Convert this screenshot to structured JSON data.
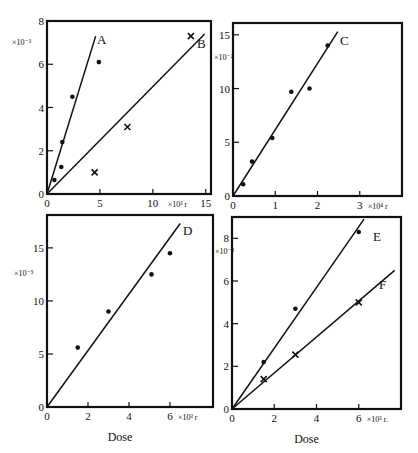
{
  "figure": {
    "width": 418,
    "height": 453,
    "ink_color": "#111111",
    "background": "#ffffff"
  },
  "chart_data": [
    {
      "type": "scatter",
      "panel": "top-left",
      "title": "",
      "xlabel": "",
      "x_unit_label": "×10³ r",
      "y_multiplier_label": "×10⁻³",
      "xlim": [
        0,
        15.5
      ],
      "ylim": [
        0,
        8
      ],
      "xticks": [
        0,
        5,
        10,
        15
      ],
      "yticks": [
        0,
        2,
        4,
        6,
        8
      ],
      "grid": false,
      "series": [
        {
          "name": "A",
          "marker": "dot",
          "points": [
            [
              0.7,
              0.65
            ],
            [
              1.35,
              1.25
            ],
            [
              1.45,
              2.4
            ],
            [
              2.4,
              4.5
            ],
            [
              4.9,
              6.1
            ]
          ],
          "fit_line": [
            [
              0,
              0
            ],
            [
              4.6,
              7.3
            ]
          ]
        },
        {
          "name": "B",
          "marker": "cross",
          "points": [
            [
              4.5,
              1.0
            ],
            [
              7.6,
              3.1
            ],
            [
              13.6,
              7.3
            ]
          ],
          "fit_line": [
            [
              0,
              0
            ],
            [
              14.9,
              7.4
            ]
          ]
        }
      ]
    },
    {
      "type": "scatter",
      "panel": "top-right",
      "title": "",
      "xlabel": "",
      "x_unit_label": "×10⁴ r",
      "y_multiplier_label": "×10⁻²",
      "xlim": [
        0,
        4.0
      ],
      "ylim": [
        0,
        16.1
      ],
      "xticks": [
        0,
        1,
        2,
        3
      ],
      "yticks": [
        0,
        5,
        10,
        15
      ],
      "grid": false,
      "series": [
        {
          "name": "C",
          "marker": "dot",
          "points": [
            [
              0.24,
              1.1
            ],
            [
              0.45,
              3.2
            ],
            [
              0.93,
              5.4
            ],
            [
              1.38,
              9.7
            ],
            [
              1.81,
              10.0
            ],
            [
              2.24,
              14.0
            ]
          ],
          "fit_line": [
            [
              0,
              0
            ],
            [
              2.48,
              15.3
            ]
          ]
        }
      ]
    },
    {
      "type": "scatter",
      "panel": "bottom-left",
      "title": "",
      "xlabel": "Dose",
      "x_unit_label": "×10³ r",
      "y_multiplier_label": "×10⁻⁵",
      "xlim": [
        0,
        8.1
      ],
      "ylim": [
        0,
        18.1
      ],
      "xticks": [
        0,
        2,
        4,
        6
      ],
      "yticks": [
        0,
        5,
        10,
        15
      ],
      "grid": false,
      "series": [
        {
          "name": "D",
          "marker": "dot",
          "points": [
            [
              1.5,
              5.6
            ],
            [
              3.0,
              9.0
            ],
            [
              5.1,
              12.5
            ],
            [
              6.0,
              14.5
            ]
          ],
          "fit_line": [
            [
              0,
              0
            ],
            [
              6.5,
              17.3
            ]
          ]
        }
      ]
    },
    {
      "type": "scatter",
      "panel": "bottom-right",
      "title": "",
      "xlabel": "Dose",
      "x_unit_label": "×10³ r.",
      "y_multiplier_label": "×10⁻³",
      "xlim": [
        0,
        8.0
      ],
      "ylim": [
        0,
        9.0
      ],
      "xticks": [
        0,
        2,
        4,
        6
      ],
      "yticks": [
        0,
        2,
        4,
        6,
        8
      ],
      "grid": false,
      "series": [
        {
          "name": "E",
          "marker": "dot",
          "points": [
            [
              1.5,
              2.2
            ],
            [
              3.0,
              4.7
            ],
            [
              6.0,
              8.3
            ]
          ],
          "fit_line": [
            [
              0,
              0
            ],
            [
              6.25,
              8.9
            ]
          ]
        },
        {
          "name": "F",
          "marker": "cross",
          "points": [
            [
              1.5,
              1.4
            ],
            [
              3.0,
              2.55
            ],
            [
              6.0,
              5.0
            ]
          ],
          "fit_line": [
            [
              0,
              0
            ],
            [
              7.7,
              6.5
            ]
          ]
        }
      ]
    }
  ],
  "layout": [
    {
      "left": 47,
      "top": 21,
      "right": 211,
      "bottom": 194,
      "label_pos": {
        "A": [
          97,
          44
        ],
        "B": [
          197,
          48
        ]
      },
      "mult_pos": [
        12,
        45
      ]
    },
    {
      "left": 233,
      "top": 23,
      "right": 402,
      "bottom": 196,
      "label_pos": {
        "C": [
          340,
          45
        ]
      },
      "mult_pos": [
        214,
        60
      ]
    },
    {
      "left": 47,
      "top": 215,
      "right": 213,
      "bottom": 407,
      "label_pos": {
        "D": [
          183,
          235
        ]
      },
      "mult_pos": [
        14,
        276
      ]
    },
    {
      "left": 232,
      "top": 217,
      "right": 401,
      "bottom": 409,
      "label_pos": {
        "E": [
          373,
          241
        ],
        "F": [
          379,
          289
        ]
      },
      "mult_pos": [
        215,
        254
      ]
    }
  ]
}
